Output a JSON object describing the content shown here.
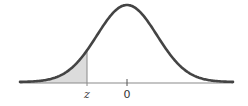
{
  "chart_data": {
    "type": "area",
    "title": "",
    "xlabel": "",
    "ylabel": "",
    "tick_labels": [
      "z",
      "0"
    ],
    "distribution": {
      "name": "standard normal",
      "mean": 0,
      "sd": 1
    },
    "shaded_region": {
      "from": "-infinity",
      "to": "z",
      "z_approx": -1.33
    },
    "xlim": [
      -3.6,
      3.5
    ],
    "grid": false,
    "legend": null
  },
  "labels": {
    "z": "z",
    "zero": "0"
  },
  "colors": {
    "curve": "#444444",
    "axis": "#8a8a8a",
    "shade": "#dcdcdc"
  }
}
